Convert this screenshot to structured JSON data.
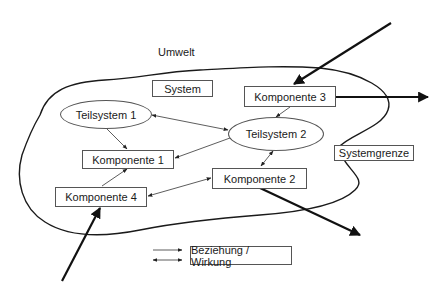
{
  "diagram": {
    "environment_label": "Umwelt",
    "system_label": "System",
    "boundary_label": "Systemgrenze",
    "subsystems": [
      {
        "id": "teilsystem-1",
        "label": "Teilsystem 1"
      },
      {
        "id": "teilsystem-2",
        "label": "Teilsystem 2"
      }
    ],
    "components": [
      {
        "id": "komponente-1",
        "label": "Komponente 1"
      },
      {
        "id": "komponente-2",
        "label": "Komponente 2"
      },
      {
        "id": "komponente-3",
        "label": "Komponente 3"
      },
      {
        "id": "komponente-4",
        "label": "Komponente 4"
      }
    ],
    "legend": {
      "label": "Beziehung / Wirkung",
      "symbols": [
        "single-arrow",
        "double-arrow"
      ]
    },
    "relations": [
      {
        "from": "Teilsystem 1",
        "to": "Komponente 1",
        "type": "single"
      },
      {
        "from": "Teilsystem 1",
        "to": "Teilsystem 2",
        "type": "double"
      },
      {
        "from": "Teilsystem 2",
        "to": "Komponente 1",
        "type": "single"
      },
      {
        "from": "Komponente 3",
        "to": "Teilsystem 2",
        "type": "single"
      },
      {
        "from": "Teilsystem 2",
        "to": "Komponente 2",
        "type": "double"
      },
      {
        "from": "Komponente 4",
        "to": "Komponente 1",
        "type": "single"
      },
      {
        "from": "Komponente 4",
        "to": "Komponente 2",
        "type": "double"
      },
      {
        "from": "Umwelt",
        "to": "Komponente 3",
        "type": "input"
      },
      {
        "from": "Komponente 3",
        "to": "Umwelt",
        "type": "output"
      },
      {
        "from": "Umwelt",
        "to": "Komponente 4",
        "type": "input"
      },
      {
        "from": "Komponente 2",
        "to": "Umwelt",
        "type": "output"
      }
    ]
  }
}
